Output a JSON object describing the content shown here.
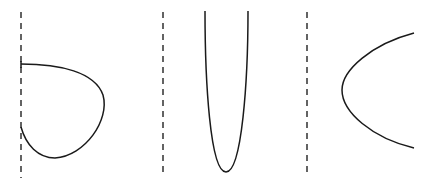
{
  "diagram": {
    "panels": [
      {
        "id": "panel-1",
        "shape": "closed-loop curve attached to dashed asymptote line",
        "dashed_line_x": 21
      },
      {
        "id": "panel-2",
        "shape": "narrow U-shaped parabola opening upward beside dashed line",
        "dashed_line_x": 163
      },
      {
        "id": "panel-3",
        "shape": "parabola opening rightward beside dashed line",
        "dashed_line_x": 306
      }
    ],
    "colors": {
      "stroke": "#1a1a1a",
      "background": "#ffffff"
    }
  }
}
